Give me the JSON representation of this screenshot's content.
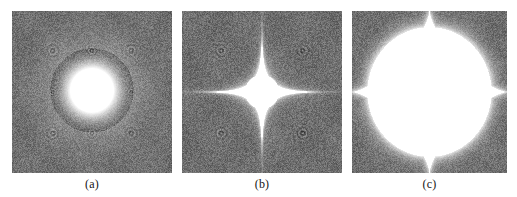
{
  "figure": {
    "background_color": "#ffffff",
    "panel_background_color": "#6e6e6e",
    "bright_color": "#ffffff",
    "caption_color": "#151515",
    "panel_count": 3
  },
  "panels": [
    {
      "id": "panel-a",
      "caption": "(a)",
      "x": 12,
      "y": 11,
      "width": 160,
      "height": 162,
      "pattern": {
        "type": "circular-blob",
        "center_x": 0.5,
        "center_y": 0.49,
        "core_radius": 0.135,
        "glow_radius": 0.26,
        "spike_count": 0,
        "description": "bright round central spot with soft radial glow"
      },
      "speckle": {
        "base_gray": "#6e6e6e",
        "noise_amplitude": 34,
        "ring_artifacts": [
          {
            "cx": 0.255,
            "cy": 0.245,
            "r": 0.036
          },
          {
            "cx": 0.5,
            "cy": 0.245,
            "r": 0.03
          },
          {
            "cx": 0.745,
            "cy": 0.245,
            "r": 0.036
          },
          {
            "cx": 0.255,
            "cy": 0.755,
            "r": 0.036
          },
          {
            "cx": 0.5,
            "cy": 0.755,
            "r": 0.03
          },
          {
            "cx": 0.745,
            "cy": 0.755,
            "r": 0.036
          },
          {
            "cx": 0.255,
            "cy": 0.5,
            "r": 0.024
          },
          {
            "cx": 0.745,
            "cy": 0.5,
            "r": 0.024
          }
        ]
      }
    },
    {
      "id": "panel-b",
      "caption": "(b)",
      "x": 182,
      "y": 11,
      "width": 160,
      "height": 162,
      "pattern": {
        "type": "astroid-star",
        "center_x": 0.5,
        "center_y": 0.5,
        "reach_x": 0.5,
        "reach_y": 0.5,
        "waist": 0.105,
        "exponent": 0.34,
        "spike_count": 4,
        "description": "thin four-pointed concave star; cusps touch all four panel edges"
      },
      "speckle": {
        "base_gray": "#6e6e6e",
        "noise_amplitude": 34,
        "ring_artifacts": [
          {
            "cx": 0.245,
            "cy": 0.245,
            "r": 0.036
          },
          {
            "cx": 0.755,
            "cy": 0.245,
            "r": 0.036
          },
          {
            "cx": 0.245,
            "cy": 0.755,
            "r": 0.036
          },
          {
            "cx": 0.755,
            "cy": 0.755,
            "r": 0.036
          },
          {
            "cx": 0.125,
            "cy": 0.5,
            "r": 0.022
          },
          {
            "cx": 0.875,
            "cy": 0.5,
            "r": 0.022
          }
        ]
      }
    },
    {
      "id": "panel-c",
      "caption": "(c)",
      "x": 352,
      "y": 11,
      "width": 155,
      "height": 162,
      "pattern": {
        "type": "astroid-star",
        "center_x": 0.5,
        "center_y": 0.5,
        "reach_x": 0.5,
        "reach_y": 0.5,
        "waist": 0.4,
        "exponent": 0.72,
        "spike_count": 4,
        "description": "large inflated four-cusped astroid filling most of the panel"
      },
      "speckle": {
        "base_gray": "#6e6e6e",
        "noise_amplitude": 34,
        "ring_artifacts": [
          {
            "cx": 0.215,
            "cy": 0.245,
            "r": 0.04
          },
          {
            "cx": 0.76,
            "cy": 0.245,
            "r": 0.04
          },
          {
            "cx": 0.215,
            "cy": 0.755,
            "r": 0.04
          },
          {
            "cx": 0.76,
            "cy": 0.755,
            "r": 0.04
          },
          {
            "cx": 0.11,
            "cy": 0.62,
            "r": 0.022
          },
          {
            "cx": 0.88,
            "cy": 0.38,
            "r": 0.022
          }
        ]
      }
    }
  ],
  "captions": {
    "a": "(a)",
    "b": "(b)",
    "c": "(c)",
    "y": 177,
    "font_size_px": 12
  }
}
